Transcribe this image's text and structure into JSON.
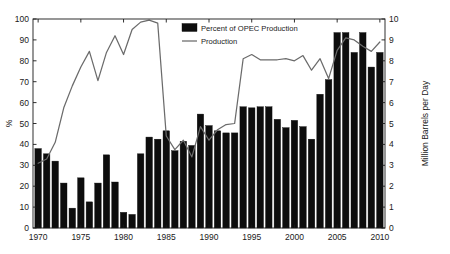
{
  "chart_data": {
    "type": "bar",
    "title": "",
    "xlabel": "",
    "ylabel": "%",
    "y2label": "Million Barrels per Day",
    "xlim": [
      1969.4,
      2010.6
    ],
    "ylim": [
      0,
      100
    ],
    "y2lim": [
      0,
      10
    ],
    "yticks": [
      0,
      10,
      20,
      30,
      40,
      50,
      60,
      70,
      80,
      90,
      100
    ],
    "y2ticks": [
      0,
      1,
      2,
      3,
      4,
      5,
      6,
      7,
      8,
      9,
      10
    ],
    "xticks": [
      1970,
      1975,
      1980,
      1985,
      1990,
      1995,
      2000,
      2005,
      2010
    ],
    "grid": false,
    "legend_position": "top-center",
    "categories": [
      1970,
      1971,
      1972,
      1973,
      1974,
      1975,
      1976,
      1977,
      1978,
      1979,
      1980,
      1981,
      1982,
      1983,
      1984,
      1985,
      1986,
      1987,
      1988,
      1989,
      1990,
      1991,
      1992,
      1993,
      1994,
      1995,
      1996,
      1997,
      1998,
      1999,
      2000,
      2001,
      2002,
      2003,
      2004,
      2005,
      2006,
      2007,
      2008,
      2009,
      2010
    ],
    "series": [
      {
        "name": "Percent of OPEC Production",
        "kind": "bar",
        "axis": "left",
        "unit": "%",
        "color": "#0d0d0d",
        "values": [
          38,
          35.5,
          32,
          21.5,
          9.5,
          24,
          12.5,
          21.5,
          35,
          22,
          7.5,
          6.5,
          35.5,
          43.5,
          42.5,
          46.5,
          37,
          41.5,
          39.5,
          54.5,
          49,
          46.5,
          45.5,
          45.5,
          58,
          57.5,
          58,
          58,
          52,
          48,
          51.5,
          48.5,
          42.5,
          64,
          71,
          93.5,
          93.5,
          84,
          93.5,
          77,
          84
        ]
      },
      {
        "name": "Production",
        "kind": "line",
        "axis": "right",
        "unit": "Million Barrels per Day",
        "color": "#6b6b6b",
        "values": [
          3.1,
          3.3,
          4.1,
          5.75,
          6.8,
          7.7,
          8.45,
          7.05,
          8.4,
          9.2,
          8.3,
          9.5,
          9.85,
          9.95,
          9.8,
          4.4,
          3.75,
          4.2,
          3.4,
          4.85,
          4.2,
          4.7,
          4.95,
          5.0,
          8.1,
          8.3,
          8.05,
          8.05,
          8.05,
          8.1,
          8.0,
          8.25,
          7.55,
          8.1,
          7.15,
          8.5,
          9.1,
          9.0,
          8.7,
          8.45,
          8.9
        ]
      }
    ]
  },
  "legend": {
    "items": [
      {
        "label": "Percent of OPEC Production",
        "marker": "filled-square"
      },
      {
        "label": "Production",
        "marker": "line-segment"
      }
    ]
  },
  "axes": {
    "left_label": "%",
    "right_label": "Million Barrels per Day",
    "left_ticks": [
      "0",
      "10",
      "20",
      "30",
      "40",
      "50",
      "60",
      "70",
      "80",
      "90",
      "100"
    ],
    "right_ticks": [
      "0",
      "1",
      "2",
      "3",
      "4",
      "5",
      "6",
      "7",
      "8",
      "9",
      "10"
    ],
    "bottom_ticks": [
      "1970",
      "1975",
      "1980",
      "1985",
      "1990",
      "1995",
      "2000",
      "2005",
      "2010"
    ]
  }
}
